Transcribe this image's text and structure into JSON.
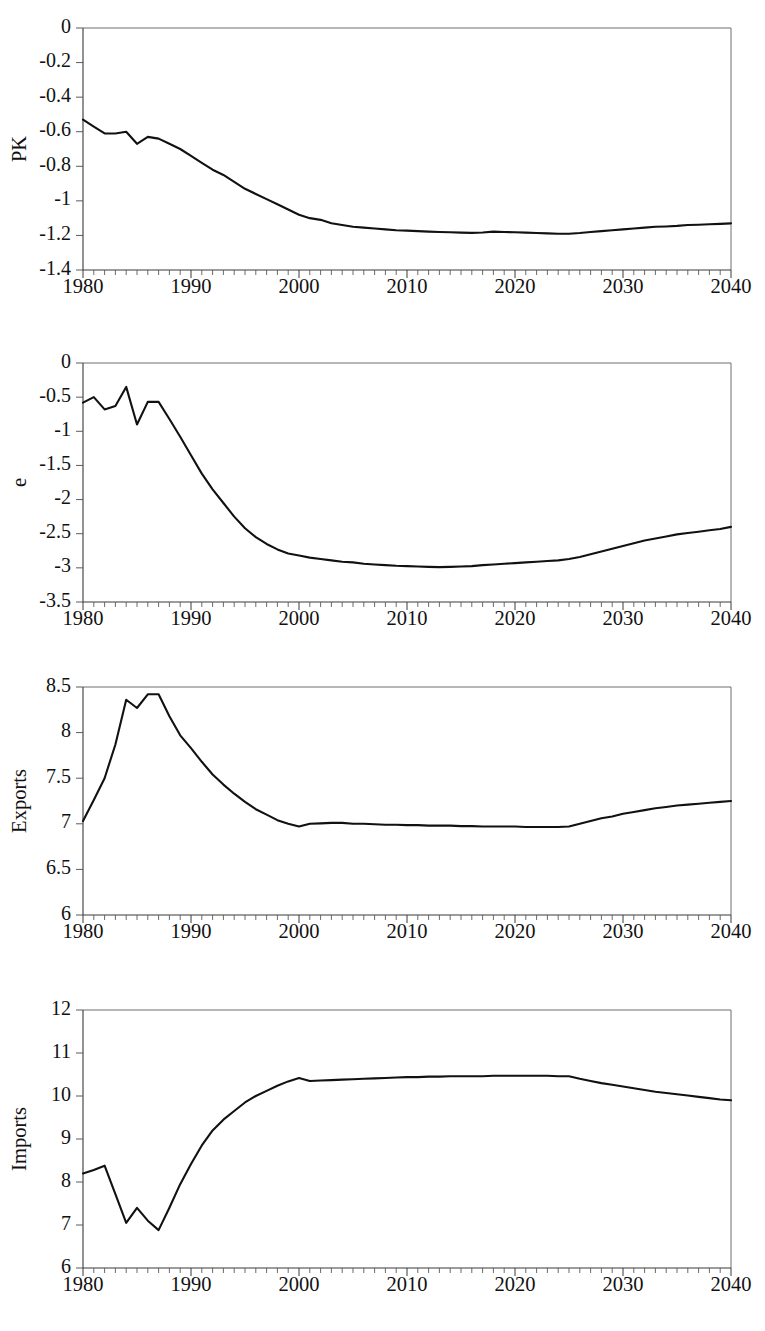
{
  "page": {
    "background": "#ffffff",
    "line_color": "#111111",
    "axis_color": "#3a3a3a",
    "width": 765,
    "height": 1331,
    "panel_count": 4
  },
  "chart_data": [
    {
      "type": "line",
      "title": "",
      "xlabel": "",
      "ylabel": "PK",
      "xlim": [
        1980,
        2040
      ],
      "ylim": [
        -1.4,
        0
      ],
      "yticks": [
        0,
        -0.2,
        -0.4,
        -0.6,
        -0.8,
        -1,
        -1.2,
        -1.4
      ],
      "ytick_labels": [
        "0",
        "-0.2",
        "-0.4",
        "-0.6",
        "-0.8",
        "-1",
        "-1.2",
        "-1.4"
      ],
      "xticks": [
        1980,
        1990,
        2000,
        2010,
        2020,
        2030,
        2040
      ],
      "xtick_labels": [
        "1980",
        "1990",
        "2000",
        "2010",
        "2020",
        "2030",
        "2040"
      ],
      "minor_xtick_interval": 1,
      "grid": false,
      "legend": "none",
      "x": [
        1980,
        1981,
        1982,
        1983,
        1984,
        1985,
        1986,
        1987,
        1988,
        1989,
        1990,
        1991,
        1992,
        1993,
        1994,
        1995,
        1996,
        1997,
        1998,
        1999,
        2000,
        2001,
        2002,
        2003,
        2004,
        2005,
        2006,
        2007,
        2008,
        2009,
        2010,
        2011,
        2012,
        2013,
        2014,
        2015,
        2016,
        2017,
        2018,
        2019,
        2020,
        2021,
        2022,
        2023,
        2024,
        2025,
        2026,
        2027,
        2028,
        2029,
        2030,
        2031,
        2032,
        2033,
        2034,
        2035,
        2036,
        2037,
        2038,
        2039,
        2040
      ],
      "values": [
        -0.53,
        -0.57,
        -0.61,
        -0.61,
        -0.6,
        -0.67,
        -0.63,
        -0.64,
        -0.67,
        -0.7,
        -0.74,
        -0.78,
        -0.82,
        -0.85,
        -0.89,
        -0.93,
        -0.96,
        -0.99,
        -1.02,
        -1.05,
        -1.08,
        -1.1,
        -1.11,
        -1.13,
        -1.14,
        -1.15,
        -1.155,
        -1.16,
        -1.165,
        -1.17,
        -1.172,
        -1.175,
        -1.178,
        -1.18,
        -1.182,
        -1.184,
        -1.185,
        -1.183,
        -1.178,
        -1.18,
        -1.182,
        -1.184,
        -1.186,
        -1.188,
        -1.19,
        -1.19,
        -1.186,
        -1.18,
        -1.175,
        -1.17,
        -1.165,
        -1.16,
        -1.155,
        -1.15,
        -1.148,
        -1.145,
        -1.14,
        -1.138,
        -1.135,
        -1.133,
        -1.13
      ]
    },
    {
      "type": "line",
      "title": "",
      "xlabel": "",
      "ylabel": "e",
      "xlim": [
        1980,
        2040
      ],
      "ylim": [
        -3.5,
        0
      ],
      "yticks": [
        0,
        -0.5,
        -1,
        -1.5,
        -2,
        -2.5,
        -3,
        -3.5
      ],
      "ytick_labels": [
        "0",
        "-0.5",
        "-1",
        "-1.5",
        "-2",
        "-2.5",
        "-3",
        "-3.5"
      ],
      "xticks": [
        1980,
        1990,
        2000,
        2010,
        2020,
        2030,
        2040
      ],
      "xtick_labels": [
        "1980",
        "1990",
        "2000",
        "2010",
        "2020",
        "2030",
        "2040"
      ],
      "minor_xtick_interval": 1,
      "grid": false,
      "legend": "none",
      "x": [
        1980,
        1981,
        1982,
        1983,
        1984,
        1985,
        1986,
        1987,
        1988,
        1989,
        1990,
        1991,
        1992,
        1993,
        1994,
        1995,
        1996,
        1997,
        1998,
        1999,
        2000,
        2001,
        2002,
        2003,
        2004,
        2005,
        2006,
        2007,
        2008,
        2009,
        2010,
        2011,
        2012,
        2013,
        2014,
        2015,
        2016,
        2017,
        2018,
        2019,
        2020,
        2021,
        2022,
        2023,
        2024,
        2025,
        2026,
        2027,
        2028,
        2029,
        2030,
        2031,
        2032,
        2033,
        2034,
        2035,
        2036,
        2037,
        2038,
        2039,
        2040
      ],
      "values": [
        -0.58,
        -0.5,
        -0.68,
        -0.63,
        -0.35,
        -0.9,
        -0.57,
        -0.57,
        -0.82,
        -1.08,
        -1.35,
        -1.62,
        -1.85,
        -2.05,
        -2.25,
        -2.42,
        -2.55,
        -2.65,
        -2.73,
        -2.79,
        -2.82,
        -2.85,
        -2.87,
        -2.89,
        -2.91,
        -2.92,
        -2.94,
        -2.95,
        -2.96,
        -2.97,
        -2.975,
        -2.98,
        -2.985,
        -2.99,
        -2.985,
        -2.98,
        -2.975,
        -2.96,
        -2.95,
        -2.94,
        -2.93,
        -2.92,
        -2.91,
        -2.9,
        -2.89,
        -2.87,
        -2.84,
        -2.8,
        -2.76,
        -2.72,
        -2.68,
        -2.64,
        -2.6,
        -2.57,
        -2.54,
        -2.51,
        -2.49,
        -2.47,
        -2.45,
        -2.43,
        -2.4
      ]
    },
    {
      "type": "line",
      "title": "",
      "xlabel": "",
      "ylabel": "Exports",
      "xlim": [
        1980,
        2040
      ],
      "ylim": [
        6,
        8.5
      ],
      "yticks": [
        8.5,
        8,
        7.5,
        7,
        6.5,
        6
      ],
      "ytick_labels": [
        "8.5",
        "8",
        "7.5",
        "7",
        "6.5",
        "6"
      ],
      "xticks": [
        1980,
        1990,
        2000,
        2010,
        2020,
        2030,
        2040
      ],
      "xtick_labels": [
        "1980",
        "1990",
        "2000",
        "2010",
        "2020",
        "2030",
        "2040"
      ],
      "minor_xtick_interval": 1,
      "grid": false,
      "legend": "none",
      "x": [
        1980,
        1981,
        1982,
        1983,
        1984,
        1985,
        1986,
        1987,
        1988,
        1989,
        1990,
        1991,
        1992,
        1993,
        1994,
        1995,
        1996,
        1997,
        1998,
        1999,
        2000,
        2001,
        2002,
        2003,
        2004,
        2005,
        2006,
        2007,
        2008,
        2009,
        2010,
        2011,
        2012,
        2013,
        2014,
        2015,
        2016,
        2017,
        2018,
        2019,
        2020,
        2021,
        2022,
        2023,
        2024,
        2025,
        2026,
        2027,
        2028,
        2029,
        2030,
        2031,
        2032,
        2033,
        2034,
        2035,
        2036,
        2037,
        2038,
        2039,
        2040
      ],
      "values": [
        7.03,
        7.26,
        7.5,
        7.87,
        8.36,
        8.27,
        8.42,
        8.42,
        8.18,
        7.97,
        7.83,
        7.68,
        7.54,
        7.43,
        7.33,
        7.24,
        7.16,
        7.1,
        7.04,
        7.0,
        6.97,
        7.0,
        7.005,
        7.01,
        7.01,
        7.0,
        7.0,
        6.995,
        6.99,
        6.99,
        6.985,
        6.985,
        6.98,
        6.98,
        6.98,
        6.975,
        6.975,
        6.97,
        6.97,
        6.97,
        6.97,
        6.965,
        6.965,
        6.965,
        6.965,
        6.97,
        7.0,
        7.03,
        7.06,
        7.08,
        7.11,
        7.13,
        7.15,
        7.17,
        7.185,
        7.2,
        7.21,
        7.22,
        7.23,
        7.24,
        7.25
      ]
    },
    {
      "type": "line",
      "title": "",
      "xlabel": "",
      "ylabel": "Imports",
      "xlim": [
        1980,
        2040
      ],
      "ylim": [
        6,
        12
      ],
      "yticks": [
        12,
        11,
        10,
        9,
        8,
        7,
        6
      ],
      "ytick_labels": [
        "12",
        "11",
        "10",
        "9",
        "8",
        "7",
        "6"
      ],
      "xticks": [
        1980,
        1990,
        2000,
        2010,
        2020,
        2030,
        2040
      ],
      "xtick_labels": [
        "1980",
        "1990",
        "2000",
        "2010",
        "2020",
        "2030",
        "2040"
      ],
      "minor_xtick_interval": 1,
      "grid": false,
      "legend": "none",
      "x": [
        1980,
        1981,
        1982,
        1983,
        1984,
        1985,
        1986,
        1987,
        1988,
        1989,
        1990,
        1991,
        1992,
        1993,
        1994,
        1995,
        1996,
        1997,
        1998,
        1999,
        2000,
        2001,
        2002,
        2003,
        2004,
        2005,
        2006,
        2007,
        2008,
        2009,
        2010,
        2011,
        2012,
        2013,
        2014,
        2015,
        2016,
        2017,
        2018,
        2019,
        2020,
        2021,
        2022,
        2023,
        2024,
        2025,
        2026,
        2027,
        2028,
        2029,
        2030,
        2031,
        2032,
        2033,
        2034,
        2035,
        2036,
        2037,
        2038,
        2039,
        2040
      ],
      "values": [
        8.2,
        8.28,
        8.38,
        7.72,
        7.05,
        7.4,
        7.1,
        6.88,
        7.4,
        7.95,
        8.42,
        8.85,
        9.2,
        9.45,
        9.65,
        9.85,
        10.0,
        10.12,
        10.24,
        10.34,
        10.42,
        10.35,
        10.36,
        10.37,
        10.38,
        10.39,
        10.4,
        10.41,
        10.42,
        10.43,
        10.44,
        10.44,
        10.45,
        10.45,
        10.46,
        10.46,
        10.46,
        10.46,
        10.47,
        10.47,
        10.47,
        10.47,
        10.47,
        10.47,
        10.46,
        10.46,
        10.4,
        10.35,
        10.3,
        10.26,
        10.22,
        10.18,
        10.14,
        10.1,
        10.07,
        10.04,
        10.01,
        9.98,
        9.95,
        9.92,
        9.9
      ]
    }
  ]
}
